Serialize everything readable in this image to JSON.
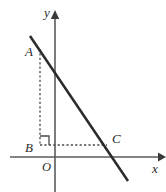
{
  "figure": {
    "width": 166,
    "height": 192,
    "background_color": "#ffffff",
    "line_color": "#2b2b2b",
    "axis_color": "#5b5b5b",
    "dash_color": "#4a4a4a"
  },
  "axes": {
    "y_axis_label": "y",
    "x_axis_label": "x",
    "origin_label": "O",
    "y_axis": {
      "x": 55,
      "y_top": 14,
      "y_bottom": 192
    },
    "x_axis": {
      "y": 157,
      "x_left": 10,
      "x_right": 160
    }
  },
  "points": [
    {
      "name": "A",
      "label": "A",
      "x": 40,
      "y": 47,
      "label_x": 25,
      "label_y": 45
    },
    {
      "name": "B",
      "label": "B",
      "x": 40,
      "y": 145,
      "label_x": 25,
      "label_y": 141
    },
    {
      "name": "C",
      "label": "C",
      "x": 108,
      "y": 145,
      "label_x": 112,
      "label_y": 132
    }
  ],
  "segments": {
    "main_line": {
      "x1": 30,
      "y1": 36,
      "x2": 128,
      "y2": 181
    },
    "dashed_vertical_AB": {
      "x1": 40,
      "y1": 49,
      "x2": 40,
      "y2": 145
    },
    "dashed_horizontal_BC": {
      "x1": 40,
      "y1": 145,
      "x2": 107,
      "y2": 145
    }
  },
  "right_angle_marker": {
    "at_point": "B",
    "size": 9,
    "corner_x": 40,
    "corner_y": 145
  },
  "icons": {
    "y_axis_arrow": "arrow-up-icon",
    "x_axis_arrow": "arrow-right-icon"
  }
}
